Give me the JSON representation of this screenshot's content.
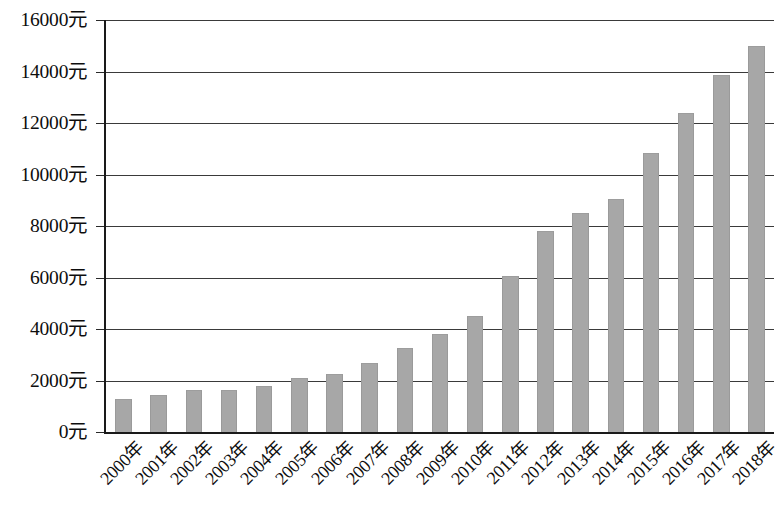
{
  "chart_data": {
    "type": "bar",
    "title": "",
    "subtitle": "",
    "xlabel": "",
    "ylabel": "",
    "ylim": [
      0,
      16000
    ],
    "ytick_step": 2000,
    "grid": true,
    "legend": false,
    "unit_suffix": "元",
    "bar_color": "#a7a7a7",
    "gridline_color": "#3a3a3a",
    "axis_color": "#1a1a1a",
    "categories": [
      "2000年",
      "2001年",
      "2002年",
      "2003年",
      "2004年",
      "2005年",
      "2006年",
      "2007年",
      "2008年",
      "2009年",
      "2010年",
      "2011年",
      "2012年",
      "2013年",
      "2014年",
      "2015年",
      "2016年",
      "2017年",
      "2018年"
    ],
    "values": [
      1300,
      1450,
      1620,
      1640,
      1800,
      2080,
      2270,
      2680,
      3250,
      3820,
      4500,
      6050,
      7800,
      8500,
      9050,
      10850,
      12400,
      13850,
      15000
    ],
    "ytick_labels": [
      "0元",
      "2000元",
      "4000元",
      "6000元",
      "8000元",
      "10000元",
      "12000元",
      "14000元",
      "16000元"
    ],
    "ytick_values": [
      0,
      2000,
      4000,
      6000,
      8000,
      10000,
      12000,
      14000,
      16000
    ]
  }
}
